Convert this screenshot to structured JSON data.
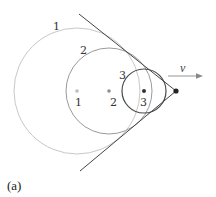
{
  "figure": {
    "caption": "(a)",
    "velocity_label": "v",
    "circles": [
      {
        "id": "1",
        "label": "1",
        "center_label": "1",
        "cx": 77,
        "cy": 91,
        "r": 63,
        "stroke": "#c8c8c8",
        "dot": "#bdbdbd"
      },
      {
        "id": "2",
        "label": "2",
        "center_label": "2",
        "cx": 109,
        "cy": 91,
        "r": 43,
        "stroke": "#9a9a9a",
        "dot": "#8f8f8f"
      },
      {
        "id": "3",
        "label": "3",
        "center_label": "3",
        "cx": 144,
        "cy": 91,
        "r": 22,
        "stroke": "#4a4a4a",
        "dot": "#333333"
      }
    ],
    "source": {
      "cx": 176,
      "cy": 91,
      "color": "#222222"
    },
    "tangent_lines": [
      {
        "x1": 79,
        "y1": 14,
        "x2": 176,
        "y2": 91
      },
      {
        "x1": 80,
        "y1": 171,
        "x2": 176,
        "y2": 91
      }
    ],
    "arrow": {
      "x1": 168,
      "y1": 76,
      "x2": 203,
      "y2": 76,
      "color": "#888888"
    }
  }
}
